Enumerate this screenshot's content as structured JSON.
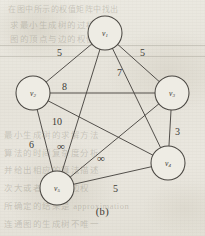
{
  "figure": {
    "caption": "(b)",
    "background_color": "#e8e6de",
    "ink_color": "#4a4742"
  },
  "chart_data": {
    "type": "diagram",
    "subtype": "weighted-undirected-graph",
    "title": "(b)",
    "node_count": 5,
    "edge_count": 10,
    "nodes": [
      {
        "id": "v1",
        "label": "v",
        "sub": "1",
        "x": 105,
        "y": 33,
        "r": 17
      },
      {
        "id": "v2",
        "label": "v",
        "sub": "2",
        "x": 33,
        "y": 93,
        "r": 17
      },
      {
        "id": "v3",
        "label": "v",
        "sub": "3",
        "x": 172,
        "y": 93,
        "r": 17
      },
      {
        "id": "v4",
        "label": "v",
        "sub": "4",
        "x": 168,
        "y": 163,
        "r": 17
      },
      {
        "id": "v5",
        "label": "v",
        "sub": "5",
        "x": 57,
        "y": 188,
        "r": 17
      }
    ],
    "edges": [
      {
        "source": "v1",
        "target": "v2",
        "weight": "5",
        "label_x": 57,
        "label_y": 48
      },
      {
        "source": "v1",
        "target": "v3",
        "weight": "5",
        "label_x": 140,
        "label_y": 48
      },
      {
        "source": "v1",
        "target": "v4",
        "weight": "7",
        "label_x": 117,
        "label_y": 68
      },
      {
        "source": "v1",
        "target": "v5",
        "weight": "∞",
        "label_x": 57,
        "label_y": 141
      },
      {
        "source": "v2",
        "target": "v3",
        "weight": "8",
        "label_x": 62,
        "label_y": 82
      },
      {
        "source": "v2",
        "target": "v4",
        "weight": "10",
        "label_x": 52,
        "label_y": 117
      },
      {
        "source": "v2",
        "target": "v5",
        "weight": "6",
        "label_x": 29,
        "label_y": 140
      },
      {
        "source": "v3",
        "target": "v4",
        "weight": "3",
        "label_x": 175,
        "label_y": 127
      },
      {
        "source": "v3",
        "target": "v5",
        "weight": "∞",
        "label_x": 97,
        "label_y": 153
      },
      {
        "source": "v4",
        "target": "v5",
        "weight": "5",
        "label_x": 113,
        "label_y": 184
      }
    ],
    "weights_legend": [
      "5",
      "5",
      "7",
      "∞",
      "8",
      "10",
      "6",
      "3",
      "∞",
      "5"
    ]
  },
  "background_text": {
    "line1": "在图中所示的权值矩阵中找出",
    "line2": "求最小生成树的过程",
    "line3": "图的顶点与边的权值",
    "line4": "最小生成树的求解方法",
    "line5": "算法的时间复杂度分析",
    "line6": "并给出相应的算法描述",
    "line7": "次大或者最小的边权",
    "line8": "所确定的结果是 approximation",
    "line9": "连通图的生成树不唯一"
  }
}
